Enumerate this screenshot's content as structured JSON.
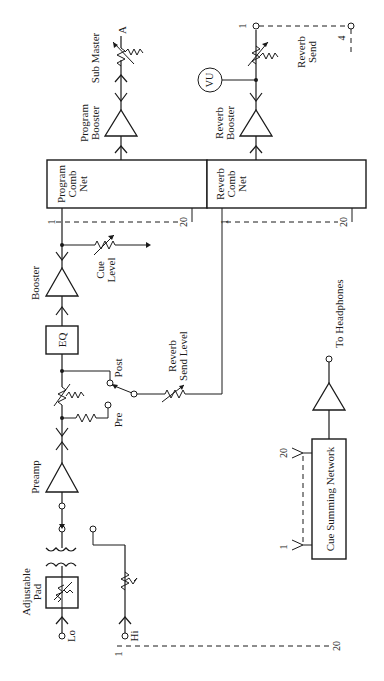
{
  "diagram": {
    "orientation": "rotated-90-ccw",
    "input_section": {
      "adjustable_pad_label_1": "Adjustable",
      "adjustable_pad_label_2": "Pad",
      "lo_input_label": "Lo",
      "hi_input_label": "Hi"
    },
    "preamp": {
      "label": "Preamp"
    },
    "fader_section": {
      "pre_label": "Pre",
      "post_label": "Post"
    },
    "eq": {
      "label": "EQ"
    },
    "booster": {
      "label": "Booster"
    },
    "cue_level": {
      "label_1": "Cue",
      "label_2": "Level"
    },
    "reverb_send_level": {
      "label_1": "Reverb",
      "label_2": "Send Level"
    },
    "program_comb_net": {
      "label_1": "Program",
      "label_2": "Comb",
      "label_3": "Net",
      "bus_start": "1",
      "bus_end": "20"
    },
    "reverb_comb_net": {
      "label_1": "Reverb",
      "label_2": "Comb",
      "label_3": "Net",
      "bus_start": "1",
      "bus_end": "20"
    },
    "program_booster": {
      "label_1": "Program",
      "label_2": "Booster"
    },
    "sub_master": {
      "label": "Sub Master",
      "output_label": "A"
    },
    "reverb_booster": {
      "label_1": "Reverb",
      "label_2": "Booster"
    },
    "vu_meter": {
      "label": "VU"
    },
    "reverb_send": {
      "label_1": "Reverb",
      "label_2": "Send",
      "bus_start": "1",
      "bus_end": "4"
    },
    "cue_summing_network": {
      "label": "Cue Summing Network",
      "input_start": "1",
      "input_end": "20"
    },
    "headphones": {
      "label": "To Headphones"
    },
    "input_bus": {
      "start": "1",
      "end": "20"
    }
  }
}
